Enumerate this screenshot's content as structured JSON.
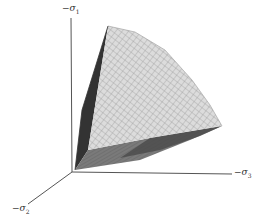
{
  "figure": {
    "axes": [
      {
        "id": "sigma1",
        "label": "−σ",
        "subscript": "1",
        "direction": "vertical"
      },
      {
        "id": "sigma2",
        "label": "−σ",
        "subscript": "2",
        "direction": "diagonal-down-left"
      },
      {
        "id": "sigma3",
        "label": "−σ",
        "subscript": "3",
        "direction": "horizontal-right"
      }
    ],
    "colors": {
      "background": "#ffffff",
      "axis": "#555555",
      "mesh_light": "#d9d9d9",
      "mesh_line": "#8a8a8a",
      "face_dark": "#3a3a3a",
      "face_mid": "#6e6e6e"
    }
  }
}
